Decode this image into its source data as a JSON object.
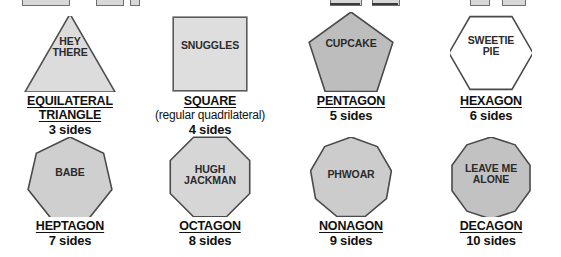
{
  "page": {
    "background": "#ffffff",
    "ink": "#111111",
    "stroke": "#4a4a4a"
  },
  "top_clipped_row": {
    "note": "partially cropped row of shapes/underlines from the line above",
    "pieces": [
      {
        "left": 22,
        "width": 46
      },
      {
        "left": 96,
        "width": 26
      },
      {
        "left": 130,
        "width": 8
      },
      {
        "left": 330,
        "width": 30
      },
      {
        "left": 372,
        "width": 26
      },
      {
        "left": 470,
        "width": 18
      },
      {
        "left": 502,
        "width": 22
      }
    ],
    "rules": [
      {
        "left": 330,
        "width": 30
      },
      {
        "left": 372,
        "width": 26
      }
    ]
  },
  "shapes": [
    {
      "key": "equilateral-triangle",
      "name_lines": [
        "EQUILATERAL",
        "TRIANGLE"
      ],
      "underline_lines": [
        true,
        true
      ],
      "subtitle": "",
      "sides_text": "3 sides",
      "sides_count": 3,
      "inner_text_lines": [
        "HEY",
        "THERE"
      ],
      "fill": "#dcdcdc",
      "stroke": "#4f4f4f",
      "filled": true
    },
    {
      "key": "square",
      "name_lines": [
        "SQUARE"
      ],
      "underline_lines": [
        true
      ],
      "subtitle": "(regular quadrilateral)",
      "sides_text": "4 sides",
      "sides_count": 4,
      "inner_text_lines": [
        "SNUGGLES"
      ],
      "fill": "#dedede",
      "stroke": "#5a5a5a",
      "filled": true
    },
    {
      "key": "pentagon",
      "name_lines": [
        "PENTAGON"
      ],
      "underline_lines": [
        true
      ],
      "subtitle": "",
      "sides_text": "5 sides",
      "sides_count": 5,
      "inner_text_lines": [
        "CUPCAKE"
      ],
      "fill": "#bdbdbd",
      "stroke": "#4a4a4a",
      "filled": true
    },
    {
      "key": "hexagon",
      "name_lines": [
        "HEXAGON"
      ],
      "underline_lines": [
        true
      ],
      "subtitle": "",
      "sides_text": "6 sides",
      "sides_count": 6,
      "inner_text_lines": [
        "SWEETIE",
        "PIE"
      ],
      "fill": "#ffffff",
      "stroke": "#4a4a4a",
      "filled": false
    },
    {
      "key": "heptagon",
      "name_lines": [
        "HEPTAGON"
      ],
      "underline_lines": [
        true
      ],
      "subtitle": "",
      "sides_text": "7 sides",
      "sides_count": 7,
      "inner_text_lines": [
        "BABE"
      ],
      "fill": "#cfcfcf",
      "stroke": "#4a4a4a",
      "filled": true
    },
    {
      "key": "octagon",
      "name_lines": [
        "OCTAGON"
      ],
      "underline_lines": [
        true
      ],
      "subtitle": "",
      "sides_text": "8 sides",
      "sides_count": 8,
      "inner_text_lines": [
        "HUGH",
        "JACKMAN"
      ],
      "fill": "#d6d6d6",
      "stroke": "#4a4a4a",
      "filled": true
    },
    {
      "key": "nonagon",
      "name_lines": [
        "NONAGON"
      ],
      "underline_lines": [
        true
      ],
      "subtitle": "",
      "sides_text": "9 sides",
      "sides_count": 9,
      "inner_text_lines": [
        "PHWOAR"
      ],
      "fill": "#cccccc",
      "stroke": "#4a4a4a",
      "filled": true
    },
    {
      "key": "decagon",
      "name_lines": [
        "DECAGON"
      ],
      "underline_lines": [
        true
      ],
      "subtitle": "",
      "sides_text": "10 sides",
      "sides_count": 10,
      "inner_text_lines": [
        "LEAVE ME",
        "ALONE"
      ],
      "fill": "#c2c2c2",
      "stroke": "#4a4a4a",
      "filled": true
    }
  ]
}
